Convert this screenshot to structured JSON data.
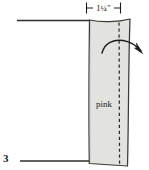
{
  "figure": {
    "number": "3",
    "type": "sewing-pattern-diagram",
    "background_color": "#ffffff"
  },
  "dimension": {
    "label": "1¼\"",
    "value": "1 1/4 inch",
    "orientation": "horizontal",
    "tick_style": "extension-ticks",
    "color": "#1a1a18"
  },
  "fabric_piece": {
    "label": "pink",
    "fill_color": "#e2e2df",
    "outline_color": "#3a3a38"
  },
  "fold_line": {
    "style": "dashed",
    "orientation": "vertical",
    "color": "#2b2b29"
  },
  "fold_arrow": {
    "direction": "fold-over-right",
    "color": "#1d1d1b"
  },
  "guide_lines": [
    {
      "name": "top-guide-line",
      "color": "#2e2e2c"
    },
    {
      "name": "bottom-guide-line",
      "color": "#2e2e2c"
    }
  ]
}
